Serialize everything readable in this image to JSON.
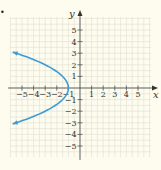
{
  "chart_data": {
    "type": "line",
    "title": "",
    "xlabel": "x",
    "ylabel": "y",
    "xlim": [
      -6,
      6
    ],
    "ylim": [
      -6,
      6
    ],
    "grid": true,
    "x_ticks": [
      -5,
      -4,
      -3,
      -2,
      -1,
      1,
      2,
      3,
      4,
      5
    ],
    "y_ticks": [
      -5,
      -4,
      -3,
      -2,
      -1,
      1,
      2,
      3,
      4,
      5
    ],
    "series": [
      {
        "name": "x = -1/2 y^2 - 1",
        "equation": "x = -0.5*y^2 - 1",
        "vertex": [
          -1,
          0
        ],
        "y_range": [
          -3.1,
          3.1
        ],
        "arrows": "both ends",
        "points": [
          {
            "x": -5.8,
            "y": 3.1
          },
          {
            "x": -5.5,
            "y": 3
          },
          {
            "x": -3,
            "y": 2
          },
          {
            "x": -1.5,
            "y": 1
          },
          {
            "x": -1,
            "y": 0
          },
          {
            "x": -1.5,
            "y": -1
          },
          {
            "x": -3,
            "y": -2
          },
          {
            "x": -5.5,
            "y": -3
          },
          {
            "x": -5.8,
            "y": -3.1
          }
        ]
      }
    ]
  },
  "colors": {
    "background": "#fdfcef",
    "grid": "#dedfd2",
    "axis": "#555555",
    "curve": "#3d9ad6"
  },
  "labels": {
    "x_axis": "x",
    "y_axis": "y",
    "bullet": "•"
  }
}
